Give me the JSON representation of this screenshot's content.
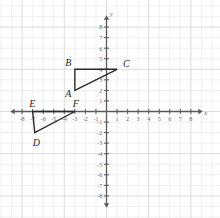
{
  "chart_data": {
    "type": "scatter",
    "title": "",
    "xlabel": "x",
    "ylabel": "y",
    "xlim": [
      -8.8,
      8.8
    ],
    "ylim": [
      -8.8,
      8.8
    ],
    "grid": true,
    "legend": "none",
    "x_ticks": [
      -8,
      -7,
      -6,
      -5,
      -4,
      -3,
      -2,
      -1,
      1,
      2,
      3,
      4,
      5,
      6,
      7,
      8
    ],
    "y_ticks": [
      -8,
      -7,
      -6,
      -5,
      -4,
      -3,
      -2,
      -1,
      1,
      2,
      3,
      4,
      5,
      6,
      7,
      8
    ],
    "x_tick_labels": [
      "-8",
      "-7",
      "-6",
      "-5",
      "-4",
      "-3",
      "-2",
      "-1",
      "1",
      "2",
      "3",
      "4",
      "5",
      "6",
      "7",
      "8"
    ],
    "y_tick_labels": [
      "-8",
      "-7",
      "-6",
      "-5",
      "-4",
      "-3",
      "-2",
      "-1",
      "1",
      "2",
      "3",
      "4",
      "5",
      "6",
      "7",
      "8"
    ],
    "shapes": [
      {
        "name": "triangle-abc",
        "vertices": [
          {
            "label": "A",
            "x": -3,
            "y": 2
          },
          {
            "label": "B",
            "x": -3,
            "y": 4
          },
          {
            "label": "C",
            "x": 1,
            "y": 4
          }
        ]
      },
      {
        "name": "triangle-def",
        "vertices": [
          {
            "label": "D",
            "x": -6.8,
            "y": -2
          },
          {
            "label": "E",
            "x": -7,
            "y": 0
          },
          {
            "label": "F",
            "x": -3,
            "y": 0
          }
        ]
      }
    ],
    "point_labels": [
      "A",
      "B",
      "C",
      "D",
      "E",
      "F"
    ],
    "colors": {
      "grid_minor": "#e9e9ec",
      "grid_major": "#d8d8dd",
      "axis": "#5a5a5a",
      "shape_stroke": "#2a2a2a",
      "tick_text": "#6d6d6d",
      "label_text": "#1d1d1d",
      "background": "#ffffff"
    }
  },
  "axis_labels": {
    "x": "x",
    "y": "y"
  },
  "vertex_labels": {
    "A": "A",
    "B": "B",
    "C": "C",
    "D": "D",
    "E": "E",
    "F": "F"
  }
}
